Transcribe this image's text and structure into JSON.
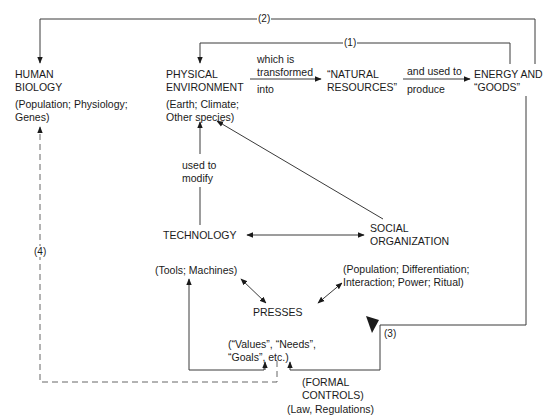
{
  "nodes": {
    "human_biology": {
      "title_line1": "HUMAN",
      "title_line2": "BIOLOGY",
      "detail_line1": "(Population; Physiology;",
      "detail_line2": "Genes)"
    },
    "physical_environment": {
      "title_line1": "PHYSICAL",
      "title_line2": "ENVIRONMENT",
      "detail_line1": "(Earth; Climate;",
      "detail_line2": "Other species)"
    },
    "natural_resources": {
      "line1": "“NATURAL",
      "line2": "RESOURCES”"
    },
    "energy_goods": {
      "line1": "ENERGY AND",
      "line2": "“GOODS”"
    },
    "technology": {
      "title": "TECHNOLOGY",
      "detail": "(Tools; Machines)"
    },
    "social_organization": {
      "title_line1": "SOCIAL",
      "title_line2": "ORGANIZATION",
      "detail_line1": "(Population; Differentiation;",
      "detail_line2": "Interaction; Power; Ritual)"
    },
    "presses": {
      "title": "PRESSES"
    },
    "values": {
      "line1": "(“Values”, “Needs”,",
      "line2": "“Goals”, etc.)"
    },
    "formal_controls": {
      "line1": "(FORMAL",
      "line2": "CONTROLS)",
      "line3": "(Law, Regulations)"
    }
  },
  "edge_labels": {
    "transformed_above_1": "which is",
    "transformed_above_2": "transformed",
    "transformed_below": "into",
    "used_above": "and used to",
    "used_below": "produce",
    "modify_1": "used to",
    "modify_2": "modify"
  },
  "loop_tags": {
    "loop1": "(1)",
    "loop2": "(2)",
    "loop3": "(3)",
    "loop4": "(4)"
  },
  "colors": {
    "line": "#3a3a3a",
    "text": "#1a1a1a",
    "dashed": "#666666"
  }
}
